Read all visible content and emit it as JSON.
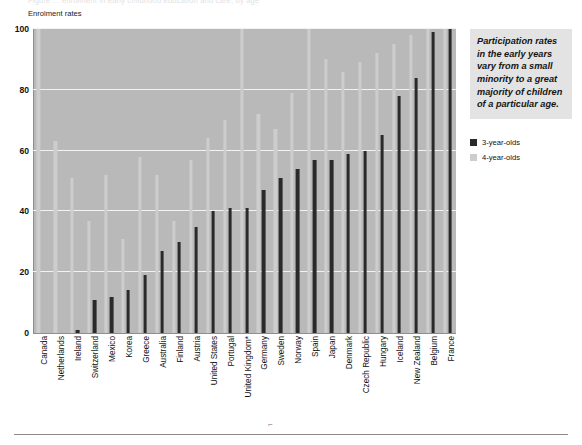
{
  "figure": {
    "top_caption": "Figure ... enrolment in early childhood education and care, by age",
    "footer_mark": "⌐"
  },
  "side_panel": {
    "note": "Participation rates in the early years vary from a small minority to a great majority of children of a particular age.",
    "legend": [
      {
        "label": "3-year-olds",
        "color": "#2a2a2a",
        "swatch_name": "legend-swatch-3-year-olds"
      },
      {
        "label": "4-year-olds",
        "color": "#cdcdcd",
        "swatch_name": "legend-swatch-4-year-olds"
      }
    ]
  },
  "chart_data": {
    "type": "bar",
    "title": "",
    "subtitle": "",
    "xlabel": "",
    "ylabel": "Enrolment rates",
    "ylim": [
      0,
      100
    ],
    "yticks": [
      0,
      20,
      40,
      60,
      80,
      100
    ],
    "grid": true,
    "legend_position": "right",
    "note": "Countries sorted by ascending 3-year-old enrolment rate. * denotes footnoted country.",
    "categories": [
      "Canada",
      "Netherlands",
      "Ireland",
      "Switzerland",
      "Mexico",
      "Korea",
      "Greece",
      "Australia",
      "Finland",
      "Austria",
      "United States",
      "Portugal",
      "United Kingdom*",
      "Germany",
      "Sweden",
      "Norway",
      "Spain",
      "Japan",
      "Denmark",
      "Czech Republic",
      "Hungary",
      "Iceland",
      "New Zealand",
      "Belgium",
      "France"
    ],
    "series": [
      {
        "name": "3-year-olds",
        "color": "#2a2a2a",
        "values": [
          0,
          0,
          1,
          11,
          12,
          14,
          19,
          27,
          30,
          35,
          40,
          41,
          41,
          47,
          51,
          54,
          57,
          57,
          59,
          60,
          65,
          78,
          84,
          99,
          100
        ]
      },
      {
        "name": "4-year-olds",
        "color": "#cdcdcd",
        "values": [
          100,
          63,
          51,
          37,
          52,
          31,
          58,
          52,
          37,
          57,
          64,
          70,
          100,
          72,
          67,
          79,
          100,
          90,
          86,
          89,
          92,
          95,
          98,
          100,
          100
        ]
      }
    ]
  }
}
